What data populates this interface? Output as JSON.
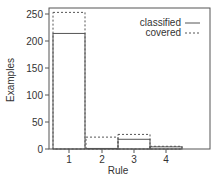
{
  "chart_data": {
    "type": "bar",
    "title": "",
    "xlabel": "Rule",
    "ylabel": "Examples",
    "categories": [
      "1",
      "2",
      "3",
      "4"
    ],
    "series": [
      {
        "name": "classified",
        "style": "solid",
        "values": [
          214,
          1,
          18,
          4
        ]
      },
      {
        "name": "covered",
        "style": "dashed",
        "values": [
          253,
          22,
          27,
          5
        ]
      }
    ],
    "ylim": [
      0,
      260
    ],
    "yticks": [
      0,
      50,
      100,
      150,
      200,
      250
    ],
    "legend_position": "upper right",
    "grid": false
  },
  "legend": {
    "items": [
      "classified",
      "covered"
    ]
  },
  "axes": {
    "xlabel": "Rule",
    "ylabel": "Examples",
    "yticks": [
      "0",
      "50",
      "100",
      "150",
      "200",
      "250"
    ],
    "xticks": [
      "1",
      "2",
      "3",
      "4"
    ]
  }
}
